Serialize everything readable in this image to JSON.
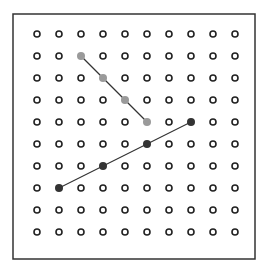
{
  "geoboard": {
    "frame": {
      "x": 13,
      "y": 14,
      "width": 242,
      "height": 245,
      "stroke": "#333333"
    },
    "grid": {
      "cols": 10,
      "rows": 10,
      "origin_x": 37,
      "origin_y": 34,
      "step_x": 22,
      "step_y": 22,
      "peg_radius": 3,
      "peg_stroke": "#222222"
    },
    "segments": [
      {
        "name": "grey-segment",
        "color": "#9a9a9a",
        "line_color": "#333333",
        "from": [
          2,
          1
        ],
        "to": [
          5,
          4
        ],
        "points": [
          [
            2,
            1
          ],
          [
            3,
            2
          ],
          [
            4,
            3
          ],
          [
            5,
            4
          ]
        ]
      },
      {
        "name": "black-segment",
        "color": "#333333",
        "line_color": "#333333",
        "from": [
          1,
          7
        ],
        "to": [
          7,
          4
        ],
        "points": [
          [
            1,
            7
          ],
          [
            3,
            6
          ],
          [
            5,
            5
          ],
          [
            7,
            4
          ]
        ]
      }
    ]
  }
}
